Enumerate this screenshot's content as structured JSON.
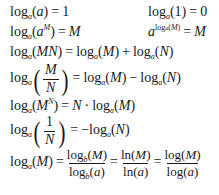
{
  "identities": {
    "log_base_itself": {
      "lhs": "log_a(a)",
      "rhs": "1",
      "eq": "="
    },
    "log_of_one": {
      "lhs": "log_a(1)",
      "rhs": "0",
      "eq": "="
    },
    "log_of_power_base": {
      "lhs": "log_a(a^M)",
      "rhs": "M",
      "eq": "="
    },
    "exp_of_log": {
      "lhs": "a^(log_a(M))",
      "rhs": "M",
      "eq": "="
    },
    "product_rule": {
      "lhs": "log_a(MN)",
      "rhs": "log_a(M) + log_a(N)",
      "eq": "="
    },
    "quotient_rule": {
      "lhs": "log_a(M/N)",
      "rhs": "log_a(M) − log_a(N)",
      "eq": "="
    },
    "power_rule": {
      "lhs": "log_a(M^N)",
      "rhs": "N · log_a(M)",
      "eq": "="
    },
    "reciprocal_rule": {
      "lhs": "log_a(1/N)",
      "rhs": "−log_a(N)",
      "eq": "="
    },
    "change_of_base": {
      "lhs": "log_a(M)",
      "rhs": [
        "log_b(M)/log_b(a)",
        "ln(M)/ln(a)",
        "log(M)/log(a)"
      ],
      "eq": "="
    }
  },
  "sym": {
    "log": "log",
    "ln": "ln",
    "a": "a",
    "b": "b",
    "M": "M",
    "N": "N",
    "MN": "MN",
    "one": "1",
    "zero": "0",
    "eq": "=",
    "plus": "+",
    "minus": "−",
    "neg": "−",
    "dot": "·",
    "lp": "(",
    "rp": ")",
    "blp": "(",
    "brp": ")"
  }
}
